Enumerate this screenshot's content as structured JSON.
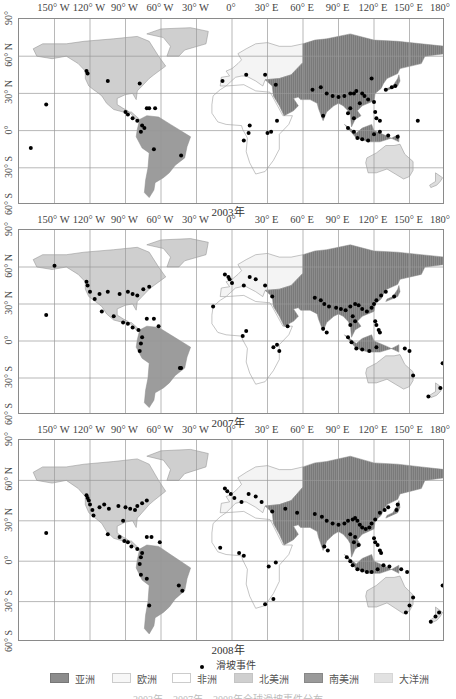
{
  "title": "2003年、2007年、2008年全球滑坡事件分布",
  "axes": {
    "longitude_labels": [
      "150° W",
      "120° W",
      "90° W",
      "60° W",
      "30° W",
      "0°",
      "30° E",
      "60° E",
      "90° E",
      "120° E",
      "150° E",
      "180°"
    ],
    "latitude_labels": [
      "90°",
      "60° N",
      "30° N",
      "0°",
      "30° S",
      "60° S"
    ]
  },
  "panels": [
    {
      "year_label": "2003年"
    },
    {
      "year_label": "2007年"
    },
    {
      "year_label": "2008年"
    }
  ],
  "legend": {
    "point_label": "滑坡事件",
    "regions": [
      {
        "label": "亚洲",
        "color": "#8c8c8c"
      },
      {
        "label": "欧洲",
        "color": "#f7f7f7"
      },
      {
        "label": "非洲",
        "color": "#ffffff"
      },
      {
        "label": "北美洲",
        "color": "#cfcfcf"
      },
      {
        "label": "南美洲",
        "color": "#9a9a9a"
      },
      {
        "label": "大洋洲",
        "color": "#e2e2e2"
      }
    ]
  },
  "colors": {
    "asia": "#8c8c8c",
    "europe": "#f4f4f4",
    "africa": "#ffffff",
    "north_america": "#cfcfcf",
    "south_america": "#9c9c9c",
    "oceania": "#dddddd",
    "event_point": "#000000",
    "grid": "#9a9a9a"
  },
  "chart_data": {
    "type": "scatter",
    "xlabel": "Longitude",
    "ylabel": "Latitude",
    "xlim": [
      -180,
      180
    ],
    "ylim": [
      -60,
      90
    ],
    "grid": true,
    "legend_position": "bottom",
    "x_ticks": [
      "150° W",
      "120° W",
      "90° W",
      "60° W",
      "30° W",
      "0°",
      "30° E",
      "60° E",
      "90° E",
      "120° E",
      "150° E",
      "180°"
    ],
    "y_ticks": [
      "90°",
      "60° N",
      "30° N",
      "0°",
      "30° S",
      "60° S"
    ],
    "series": [
      {
        "name": "2003年",
        "points_lonlat": [
          [
            -157,
            21
          ],
          [
            -170,
            -14
          ],
          [
            -123,
            48
          ],
          [
            -122,
            46
          ],
          [
            -105,
            40
          ],
          [
            -78,
            38
          ],
          [
            -65,
            18
          ],
          [
            -72,
            18
          ],
          [
            -70,
            18
          ],
          [
            -90,
            15
          ],
          [
            -88,
            13
          ],
          [
            -84,
            10
          ],
          [
            -80,
            8
          ],
          [
            -76,
            4
          ],
          [
            -74,
            2
          ],
          [
            -77,
            -1
          ],
          [
            -66,
            -15
          ],
          [
            -43,
            -20
          ],
          [
            -8,
            40
          ],
          [
            12,
            45
          ],
          [
            28,
            45
          ],
          [
            37,
            37
          ],
          [
            15,
            4
          ],
          [
            14,
            -2
          ],
          [
            10,
            -8
          ],
          [
            33,
            -1
          ],
          [
            30,
            -2
          ],
          [
            38,
            8
          ],
          [
            68,
            33
          ],
          [
            75,
            35
          ],
          [
            80,
            30
          ],
          [
            85,
            28
          ],
          [
            90,
            27
          ],
          [
            95,
            28
          ],
          [
            100,
            30
          ],
          [
            103,
            30
          ],
          [
            105,
            32
          ],
          [
            110,
            30
          ],
          [
            112,
            28
          ],
          [
            115,
            25
          ],
          [
            120,
            23
          ],
          [
            108,
            22
          ],
          [
            100,
            18
          ],
          [
            98,
            14
          ],
          [
            103,
            10
          ],
          [
            77,
            12
          ],
          [
            121,
            15
          ],
          [
            122,
            10
          ],
          [
            125,
            8
          ],
          [
            98,
            2
          ],
          [
            103,
            -1
          ],
          [
            106,
            -6
          ],
          [
            110,
            -7
          ],
          [
            115,
            -8
          ],
          [
            120,
            -3
          ],
          [
            125,
            -1
          ],
          [
            132,
            -4
          ],
          [
            140,
            -5
          ],
          [
            138,
            36
          ],
          [
            135,
            35
          ],
          [
            130,
            33
          ],
          [
            157,
            8
          ],
          [
            118,
            42
          ]
        ]
      },
      {
        "name": "2007年",
        "points_lonlat": [
          [
            -157,
            21
          ],
          [
            -150,
            61
          ],
          [
            -123,
            48
          ],
          [
            -122,
            45
          ],
          [
            -120,
            40
          ],
          [
            -116,
            34
          ],
          [
            -112,
            38
          ],
          [
            -105,
            40
          ],
          [
            -95,
            38
          ],
          [
            -88,
            40
          ],
          [
            -84,
            38
          ],
          [
            -80,
            37
          ],
          [
            -75,
            42
          ],
          [
            -70,
            44
          ],
          [
            -110,
            24
          ],
          [
            -100,
            20
          ],
          [
            -92,
            15
          ],
          [
            -88,
            14
          ],
          [
            -84,
            11
          ],
          [
            -79,
            9
          ],
          [
            -72,
            18
          ],
          [
            -66,
            18
          ],
          [
            -62,
            12
          ],
          [
            -76,
            3
          ],
          [
            -77,
            -2
          ],
          [
            -78,
            -8
          ],
          [
            -44,
            -22
          ],
          [
            -43,
            -22
          ],
          [
            -6,
            54
          ],
          [
            -3,
            52
          ],
          [
            -2,
            50
          ],
          [
            0,
            47
          ],
          [
            10,
            45
          ],
          [
            15,
            52
          ],
          [
            20,
            50
          ],
          [
            28,
            45
          ],
          [
            34,
            36
          ],
          [
            -16,
            28
          ],
          [
            12,
            8
          ],
          [
            9,
            4
          ],
          [
            35,
            -5
          ],
          [
            38,
            -3
          ],
          [
            40,
            -8
          ],
          [
            47,
            12
          ],
          [
            70,
            35
          ],
          [
            75,
            33
          ],
          [
            78,
            30
          ],
          [
            82,
            28
          ],
          [
            88,
            27
          ],
          [
            92,
            26
          ],
          [
            96,
            25
          ],
          [
            100,
            28
          ],
          [
            104,
            30
          ],
          [
            107,
            29
          ],
          [
            110,
            26
          ],
          [
            114,
            24
          ],
          [
            118,
            27
          ],
          [
            120,
            30
          ],
          [
            122,
            33
          ],
          [
            126,
            37
          ],
          [
            130,
            40
          ],
          [
            137,
            36
          ],
          [
            102,
            20
          ],
          [
            104,
            16
          ],
          [
            100,
            13
          ],
          [
            77,
            10
          ],
          [
            80,
            7
          ],
          [
            121,
            16
          ],
          [
            122,
            13
          ],
          [
            124,
            9
          ],
          [
            125,
            7
          ],
          [
            98,
            3
          ],
          [
            101,
            -1
          ],
          [
            105,
            -6
          ],
          [
            110,
            -7
          ],
          [
            116,
            -8
          ],
          [
            122,
            -5
          ],
          [
            146,
            -6
          ],
          [
            150,
            -8
          ],
          [
            153,
            -28
          ],
          [
            176,
            -38
          ],
          [
            178,
            -18
          ],
          [
            166,
            -45
          ]
        ]
      },
      {
        "name": "2008年",
        "points_lonlat": [
          [
            -157,
            21
          ],
          [
            -123,
            49
          ],
          [
            -122,
            47
          ],
          [
            -121,
            45
          ],
          [
            -120,
            42
          ],
          [
            -118,
            38
          ],
          [
            -117,
            34
          ],
          [
            -112,
            40
          ],
          [
            -108,
            42
          ],
          [
            -104,
            39
          ],
          [
            -96,
            41
          ],
          [
            -90,
            40
          ],
          [
            -86,
            39
          ],
          [
            -82,
            38
          ],
          [
            -80,
            41
          ],
          [
            -76,
            43
          ],
          [
            -72,
            45
          ],
          [
            -92,
            30
          ],
          [
            -105,
            20
          ],
          [
            -95,
            18
          ],
          [
            -91,
            15
          ],
          [
            -88,
            14
          ],
          [
            -85,
            11
          ],
          [
            -80,
            9
          ],
          [
            -72,
            18
          ],
          [
            -68,
            18
          ],
          [
            -61,
            14
          ],
          [
            -76,
            6
          ],
          [
            -77,
            3
          ],
          [
            -78,
            -2
          ],
          [
            -77,
            -10
          ],
          [
            -72,
            -13
          ],
          [
            -45,
            -18
          ],
          [
            -42,
            -22
          ],
          [
            -70,
            -33
          ],
          [
            -6,
            54
          ],
          [
            -4,
            52
          ],
          [
            -1,
            50
          ],
          [
            2,
            47
          ],
          [
            8,
            44
          ],
          [
            14,
            50
          ],
          [
            20,
            48
          ],
          [
            25,
            44
          ],
          [
            34,
            37
          ],
          [
            -10,
            10
          ],
          [
            6,
            6
          ],
          [
            10,
            4
          ],
          [
            37,
            -1
          ],
          [
            31,
            -4
          ],
          [
            35,
            -28
          ],
          [
            28,
            -32
          ],
          [
            45,
            39
          ],
          [
            55,
            36
          ],
          [
            70,
            35
          ],
          [
            76,
            33
          ],
          [
            80,
            30
          ],
          [
            85,
            28
          ],
          [
            90,
            27
          ],
          [
            95,
            28
          ],
          [
            98,
            30
          ],
          [
            102,
            31
          ],
          [
            104,
            32
          ],
          [
            106,
            30
          ],
          [
            108,
            27
          ],
          [
            110,
            25
          ],
          [
            113,
            24
          ],
          [
            116,
            25
          ],
          [
            118,
            28
          ],
          [
            121,
            31
          ],
          [
            125,
            36
          ],
          [
            129,
            38
          ],
          [
            132,
            40
          ],
          [
            139,
            38
          ],
          [
            140,
            42
          ],
          [
            100,
            20
          ],
          [
            104,
            18
          ],
          [
            103,
            14
          ],
          [
            107,
            12
          ],
          [
            78,
            11
          ],
          [
            81,
            8
          ],
          [
            120,
            17
          ],
          [
            121,
            14
          ],
          [
            123,
            12
          ],
          [
            125,
            8
          ],
          [
            126,
            6
          ],
          [
            97,
            3
          ],
          [
            100,
            0
          ],
          [
            102,
            -3
          ],
          [
            106,
            -6
          ],
          [
            110,
            -7
          ],
          [
            114,
            -8
          ],
          [
            118,
            -8
          ],
          [
            123,
            -6
          ],
          [
            128,
            -3
          ],
          [
            133,
            -4
          ],
          [
            143,
            -6
          ],
          [
            148,
            -8
          ],
          [
            153,
            -27
          ],
          [
            150,
            -33
          ],
          [
            147,
            -38
          ],
          [
            172,
            -41
          ],
          [
            175,
            -38
          ],
          [
            178,
            -18
          ],
          [
            168,
            -45
          ]
        ]
      }
    ]
  }
}
